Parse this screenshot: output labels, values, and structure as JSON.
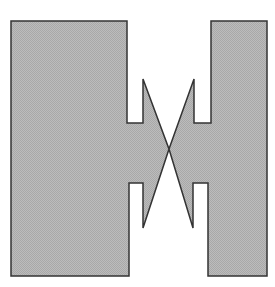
{
  "figure": {
    "width": 275,
    "height": 287,
    "background": "#ffffff",
    "shape": {
      "name": "double-h-shape-with-crossed-spikes",
      "fill": "#b4b4b4",
      "stroke": "#333333",
      "stroke_width": 1.5,
      "points": [
        [
          11,
          21
        ],
        [
          127,
          21
        ],
        [
          127,
          123
        ],
        [
          143,
          123
        ],
        [
          143,
          79
        ],
        [
          169,
          149
        ],
        [
          194,
          79
        ],
        [
          194,
          123
        ],
        [
          211,
          123
        ],
        [
          211,
          21
        ],
        [
          267,
          21
        ],
        [
          267,
          276
        ],
        [
          208,
          276
        ],
        [
          208,
          183
        ],
        [
          193,
          183
        ],
        [
          193,
          228
        ],
        [
          169,
          149
        ],
        [
          143,
          228
        ],
        [
          143,
          183
        ],
        [
          129,
          183
        ],
        [
          129,
          276
        ],
        [
          11,
          276
        ]
      ]
    }
  }
}
